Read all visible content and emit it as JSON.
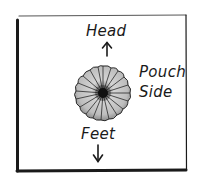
{
  "diagram": {
    "type": "hand-drawn orientation diagram",
    "labels": {
      "top": "Head",
      "right_line1": "Pouch",
      "right_line2": "Side",
      "bottom": "Feet"
    },
    "arrows": {
      "top": "up-arrow",
      "bottom": "down-arrow"
    },
    "center_object": "pouch-icon",
    "colors": {
      "ink": "#1a1a1a",
      "pouch_fill": "#c8c8c8",
      "pouch_shade": "#8a8a8a",
      "background": "#ffffff"
    }
  }
}
